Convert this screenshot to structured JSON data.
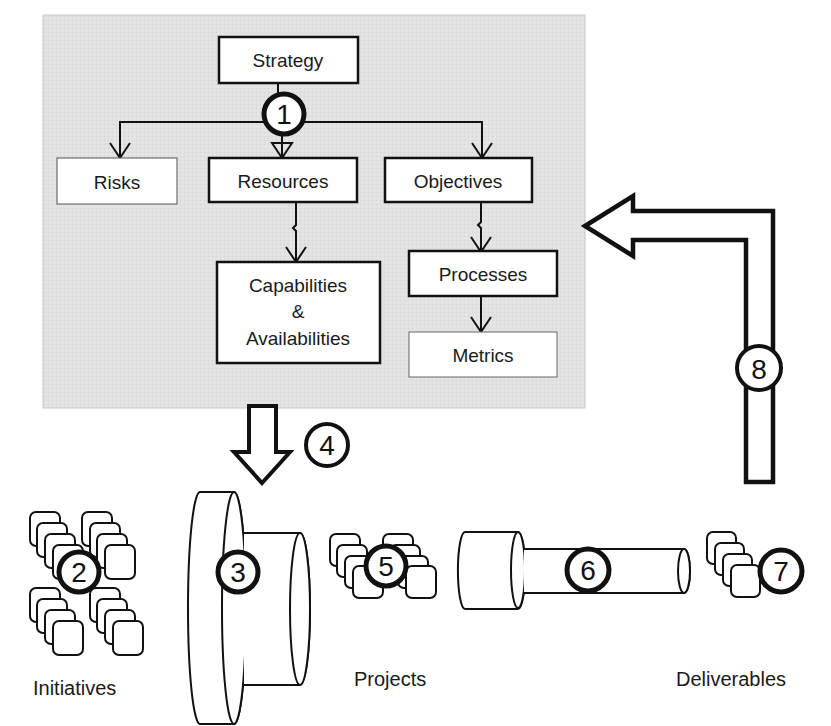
{
  "diagram": {
    "strategy_panel": {
      "background": "#e3e3e3",
      "nodes": {
        "strategy": "Strategy",
        "risks": "Risks",
        "resources": "Resources",
        "objectives": "Objectives",
        "capabilities_line1": "Capabilities",
        "capabilities_line2": "&",
        "capabilities_line3": "Availabilities",
        "processes": "Processes",
        "metrics": "Metrics"
      }
    },
    "markers": [
      "1",
      "2",
      "3",
      "4",
      "5",
      "6",
      "7",
      "8"
    ],
    "bottom_labels": {
      "initiatives": "Initiatives",
      "projects": "Projects",
      "deliverables": "Deliverables"
    }
  }
}
